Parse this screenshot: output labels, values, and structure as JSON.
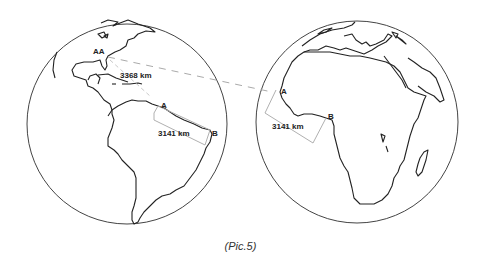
{
  "figure": {
    "caption": "(Pic.5)",
    "left_globe": {
      "region": "Americas",
      "labels": {
        "point_aa": "AA",
        "distance_aa": "3368 km",
        "point_a": "A",
        "point_b": "B",
        "distance_ab": "3141 km"
      }
    },
    "right_globe": {
      "region": "Africa and Europe",
      "labels": {
        "point_a": "A",
        "point_b": "B",
        "distance_ab": "3141 km"
      }
    },
    "colors": {
      "outline": "#333333",
      "measurement_line": "#b0b0b0",
      "dashed_connector": "#aaaaaa"
    }
  }
}
